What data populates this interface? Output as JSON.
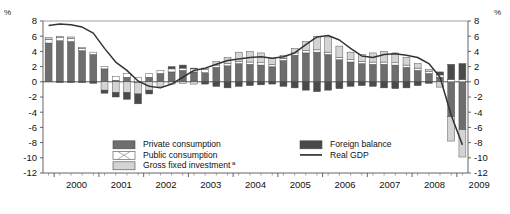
{
  "axis": {
    "left_unit": "%",
    "right_unit": "%",
    "y_ticks": [
      8,
      6,
      4,
      2,
      0,
      -2,
      -4,
      -6,
      -8,
      -10,
      -12
    ],
    "x_ticks": [
      "2000",
      "2001",
      "2002",
      "2003",
      "2004",
      "2005",
      "2006",
      "2007",
      "2008",
      "2009"
    ]
  },
  "legend": {
    "items": [
      {
        "label": "Private consumption",
        "swatch": "private-consumption-swatch",
        "color": "#6e6e6e"
      },
      {
        "label": "Public consumption",
        "swatch": "public-consumption-swatch",
        "color": "#ffffff"
      },
      {
        "label": "Gross fixed investment",
        "superscript": "a",
        "swatch": "gross-fixed-investment-swatch",
        "color": "#d4d4d4"
      },
      {
        "label": "Foreign balance",
        "swatch": "foreign-balance-swatch",
        "color": "#4a4a4a"
      },
      {
        "label": "Real GDP",
        "swatch": "real-gdp-line",
        "color": "#333333"
      }
    ]
  },
  "chart_data": {
    "type": "bar",
    "title": "",
    "subtitle": "",
    "xlabel": "",
    "ylabel": "%",
    "ylim": [
      -12,
      8
    ],
    "xlim": [
      "1999Q4",
      "2009Q1"
    ],
    "grid": false,
    "legend_position": "inside-bottom",
    "stacked": true,
    "note": "Quarterly contributions to real GDP growth (year-on-year, percentage points) with Real GDP growth line overlay.",
    "categories": [
      "1999Q4",
      "2000Q1",
      "2000Q2",
      "2000Q3",
      "2000Q4",
      "2001Q1",
      "2001Q2",
      "2001Q3",
      "2001Q4",
      "2002Q1",
      "2002Q2",
      "2002Q3",
      "2002Q4",
      "2003Q1",
      "2003Q2",
      "2003Q3",
      "2003Q4",
      "2004Q1",
      "2004Q2",
      "2004Q3",
      "2004Q4",
      "2005Q1",
      "2005Q2",
      "2005Q3",
      "2005Q4",
      "2006Q1",
      "2006Q2",
      "2006Q3",
      "2006Q4",
      "2007Q1",
      "2007Q2",
      "2007Q3",
      "2007Q4",
      "2008Q1",
      "2008Q2",
      "2008Q3",
      "2008Q4",
      "2009Q1"
    ],
    "series": [
      {
        "name": "Private consumption",
        "color": "#6e6e6e",
        "values": [
          5.1,
          5.4,
          5.3,
          4.1,
          3.6,
          1.7,
          0.2,
          0.6,
          -0.1,
          0.6,
          1.1,
          1.3,
          1.5,
          1.3,
          1.2,
          1.9,
          2.1,
          2.4,
          2.3,
          2.2,
          2.0,
          2.8,
          3.5,
          3.8,
          3.9,
          3.6,
          2.9,
          2.6,
          2.4,
          2.3,
          2.3,
          2.2,
          1.9,
          1.5,
          1.1,
          0.6,
          -4.6,
          -6.3
        ]
      },
      {
        "name": "Public consumption",
        "color": "#ffffff",
        "values": [
          0.5,
          0.4,
          0.4,
          0.3,
          0.3,
          0.3,
          0.5,
          0.5,
          0.6,
          0.5,
          0.4,
          0.4,
          0.3,
          0.4,
          0.4,
          0.3,
          0.3,
          0.3,
          0.3,
          0.3,
          0.3,
          0.3,
          0.3,
          0.3,
          0.3,
          0.3,
          0.3,
          0.3,
          0.3,
          0.3,
          0.3,
          0.3,
          0.3,
          0.3,
          0.3,
          0.3,
          0.3,
          0.3
        ]
      },
      {
        "name": "Gross fixed investment",
        "color": "#d4d4d4",
        "values": [
          0.2,
          0.2,
          0.2,
          0.1,
          0.0,
          -1.1,
          -1.4,
          -1.4,
          -1.5,
          -1.1,
          -0.6,
          -0.3,
          -0.2,
          -0.3,
          0.2,
          0.5,
          0.8,
          1.2,
          1.4,
          1.3,
          0.8,
          0.4,
          0.6,
          1.2,
          1.8,
          2.0,
          1.5,
          1.0,
          0.9,
          1.2,
          1.4,
          1.3,
          1.0,
          0.6,
          0.2,
          -0.7,
          -3.2,
          -3.6
        ]
      },
      {
        "name": "Foreign balance",
        "color": "#4a4a4a",
        "values": [
          0.0,
          -0.1,
          -0.1,
          -0.1,
          -0.2,
          -0.4,
          -0.6,
          -0.9,
          -1.3,
          -0.5,
          0.0,
          0.3,
          0.4,
          0.1,
          -0.3,
          -0.6,
          -0.8,
          -0.6,
          -0.5,
          -0.4,
          -0.3,
          -0.6,
          -0.8,
          -1.1,
          -1.3,
          -1.1,
          -0.9,
          -0.6,
          -0.5,
          -0.6,
          -0.8,
          -0.9,
          -0.8,
          -0.5,
          -0.2,
          0.4,
          2.0,
          2.1
        ]
      }
    ],
    "line_series": {
      "name": "Real GDP",
      "color": "#333333",
      "values": [
        7.4,
        7.6,
        7.5,
        7.2,
        6.4,
        4.4,
        2.6,
        1.5,
        0.1,
        -0.6,
        -0.8,
        -0.3,
        0.6,
        1.5,
        1.8,
        2.3,
        2.8,
        3.0,
        3.2,
        3.3,
        3.1,
        3.3,
        3.8,
        4.9,
        5.9,
        6.1,
        5.5,
        4.4,
        3.4,
        3.2,
        3.6,
        3.7,
        3.5,
        3.2,
        2.4,
        0.6,
        -4.4,
        -8.3
      ]
    }
  }
}
